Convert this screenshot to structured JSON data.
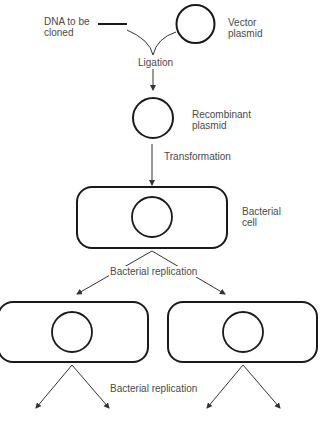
{
  "diagram": {
    "colors": {
      "stroke": "#1a1a1a",
      "arrow": "#333333",
      "text": "#4a4a4a",
      "background": "#ffffff"
    },
    "labels": {
      "dna_to_be_cloned": "DNA to be\ncloned",
      "vector_plasmid": "Vector\nplasmid",
      "ligation": "Ligation",
      "recombinant_plasmid": "Recombinant\nplasmid",
      "transformation": "Transformation",
      "bacterial_cell": "Bacterial\ncell",
      "bacterial_replication_1": "Bacterial replication",
      "bacterial_replication_2": "Bacterial replication"
    },
    "nodes": [
      {
        "id": "dna-fragment",
        "type": "line",
        "label": "DNA to be cloned"
      },
      {
        "id": "vector-plasmid",
        "type": "circle",
        "label": "Vector plasmid"
      },
      {
        "id": "recombinant-plasmid",
        "type": "circle",
        "label": "Recombinant plasmid"
      },
      {
        "id": "bacterial-cell",
        "type": "rounded-rect-with-plasmid",
        "label": "Bacterial cell"
      },
      {
        "id": "daughter-cell-left",
        "type": "rounded-rect-with-plasmid",
        "label": ""
      },
      {
        "id": "daughter-cell-right",
        "type": "rounded-rect-with-plasmid",
        "label": ""
      }
    ],
    "edges": [
      {
        "from": "dna-fragment",
        "to": "recombinant-plasmid",
        "label": "Ligation"
      },
      {
        "from": "vector-plasmid",
        "to": "recombinant-plasmid",
        "label": "Ligation"
      },
      {
        "from": "recombinant-plasmid",
        "to": "bacterial-cell",
        "label": "Transformation"
      },
      {
        "from": "bacterial-cell",
        "to": "daughter-cell-left",
        "label": "Bacterial replication"
      },
      {
        "from": "bacterial-cell",
        "to": "daughter-cell-right",
        "label": "Bacterial replication"
      },
      {
        "from": "daughter-cell-left",
        "to": "offspring-1",
        "label": "Bacterial replication"
      },
      {
        "from": "daughter-cell-left",
        "to": "offspring-2",
        "label": "Bacterial replication"
      },
      {
        "from": "daughter-cell-right",
        "to": "offspring-3",
        "label": "Bacterial replication"
      },
      {
        "from": "daughter-cell-right",
        "to": "offspring-4",
        "label": "Bacterial replication"
      }
    ]
  }
}
